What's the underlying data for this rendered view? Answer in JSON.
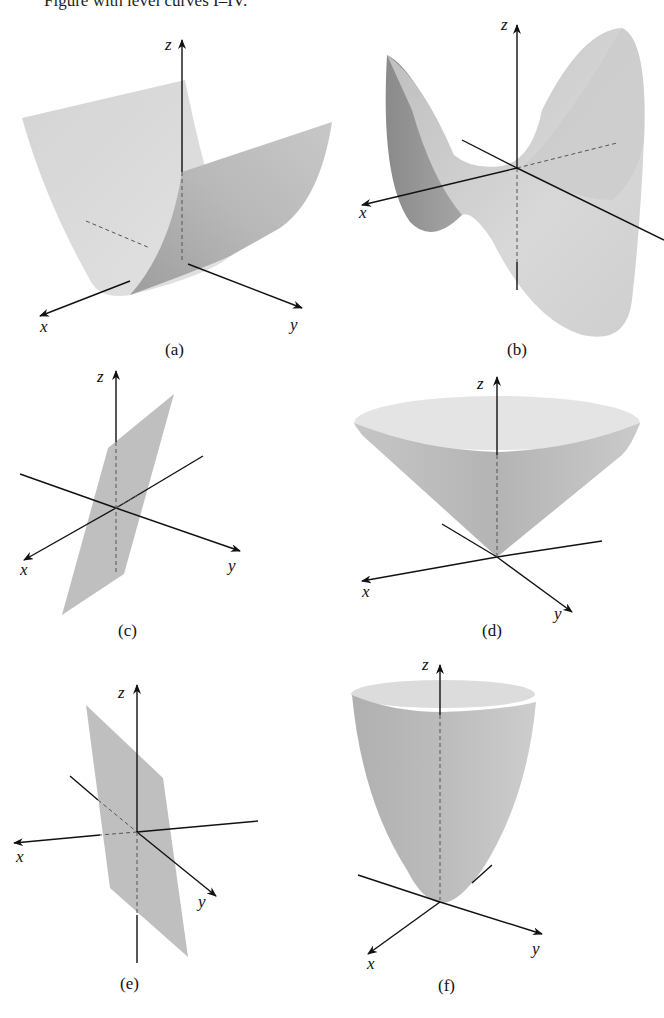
{
  "header": {
    "text": "Figure with level curves I–IV."
  },
  "figures": [
    {
      "id": "a",
      "caption": "(a)",
      "surface": "parabolic cylinder",
      "axes": {
        "x": "x",
        "y": "y",
        "z": "z"
      }
    },
    {
      "id": "b",
      "caption": "(b)",
      "surface": "hyperbolic paraboloid (saddle)",
      "axes": {
        "x": "x",
        "y": "y",
        "z": "z"
      }
    },
    {
      "id": "c",
      "caption": "(c)",
      "surface": "plane",
      "axes": {
        "x": "x",
        "y": "y",
        "z": "z"
      }
    },
    {
      "id": "d",
      "caption": "(d)",
      "surface": "cone",
      "axes": {
        "x": "x",
        "y": "y",
        "z": "z"
      }
    },
    {
      "id": "e",
      "caption": "(e)",
      "surface": "plane",
      "axes": {
        "x": "x",
        "y": "y",
        "z": "z"
      }
    },
    {
      "id": "f",
      "caption": "(f)",
      "surface": "elliptic paraboloid",
      "axes": {
        "x": "x",
        "y": "y",
        "z": "z"
      }
    }
  ],
  "colors": {
    "surface_light": "#d9d9d9",
    "surface_mid": "#bdbdbd",
    "surface_dark": "#8f8f8f",
    "axis": "#111111"
  }
}
